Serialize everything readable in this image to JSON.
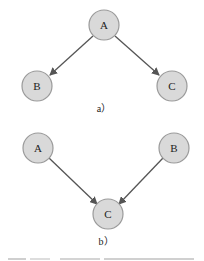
{
  "diagrams": [
    {
      "id": "a",
      "label": "a）",
      "nodes": [
        {
          "id": "A",
          "label": "A"
        },
        {
          "id": "B",
          "label": "B"
        },
        {
          "id": "C",
          "label": "C"
        }
      ],
      "edges": [
        {
          "from": "A",
          "to": "B"
        },
        {
          "from": "A",
          "to": "C"
        }
      ]
    },
    {
      "id": "b",
      "label": "b）",
      "nodes": [
        {
          "id": "A",
          "label": "A"
        },
        {
          "id": "B",
          "label": "B"
        },
        {
          "id": "C",
          "label": "C"
        }
      ],
      "edges": [
        {
          "from": "A",
          "to": "C"
        },
        {
          "from": "B",
          "to": "C"
        }
      ]
    }
  ],
  "colors": {
    "node_fill": "#d9d9d9",
    "node_stroke": "#9a9a9a",
    "edge": "#555555"
  }
}
